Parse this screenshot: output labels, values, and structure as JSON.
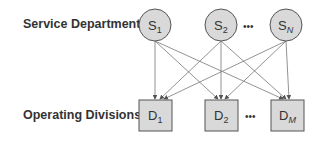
{
  "labels": {
    "service_row": "Service Departments:",
    "operating_row": "Operating Divisions:"
  },
  "service_nodes": [
    {
      "letter": "S",
      "sub": "1"
    },
    {
      "letter": "S",
      "sub": "2"
    },
    {
      "letter": "S",
      "sub": "N"
    }
  ],
  "division_nodes": [
    {
      "letter": "D",
      "sub": "1"
    },
    {
      "letter": "D",
      "sub": "2"
    },
    {
      "letter": "D",
      "sub": "M"
    }
  ],
  "ellipsis": "•••",
  "colors": {
    "node_fill": "#d9d9d9",
    "node_stroke": "#555555",
    "arrow": "#666666"
  }
}
